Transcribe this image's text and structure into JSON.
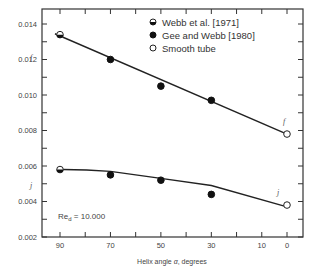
{
  "chart_data": {
    "type": "scatter",
    "title": "",
    "xlabel": "Helix angle α, degrees",
    "ylabel": "f",
    "xlim": [
      90,
      0
    ],
    "ylim": [
      0.002,
      0.014
    ],
    "x_ticks": [
      90,
      80,
      70,
      60,
      50,
      40,
      30,
      20,
      10,
      0
    ],
    "x_tick_labels": [
      "90",
      "70",
      "50",
      "30",
      "10",
      "0"
    ],
    "y_ticks": [
      0.002,
      0.003,
      0.004,
      0.005,
      0.006,
      0.007,
      0.008,
      0.009,
      0.01,
      0.011,
      0.012,
      0.013,
      0.014
    ],
    "y_tick_labels": [
      "0.002",
      "0.004",
      "0.006",
      "0.008",
      "0.010",
      "0.012",
      "0.014"
    ],
    "grid": false,
    "legend_position": "upper right",
    "annotation": "Re_d = 10,000",
    "series": [
      {
        "name": "Webb et al. [1971]",
        "marker": "half-filled circle",
        "group": "upper",
        "x": [
          90
        ],
        "y": [
          0.0134
        ]
      },
      {
        "name": "Gee and Webb [1980]",
        "marker": "filled circle",
        "group": "upper",
        "x": [
          70,
          50,
          30
        ],
        "y": [
          0.012,
          0.0105,
          0.0097
        ]
      },
      {
        "name": "Smooth tube",
        "marker": "open circle",
        "group": "upper",
        "x": [
          0
        ],
        "y": [
          0.0078
        ]
      },
      {
        "name": "Webb et al. [1971]",
        "marker": "half-filled circle",
        "group": "lower",
        "x": [
          90
        ],
        "y": [
          0.0058
        ]
      },
      {
        "name": "Gee and Webb [1980]",
        "marker": "filled circle",
        "group": "lower",
        "x": [
          70,
          50,
          30
        ],
        "y": [
          0.0055,
          0.0052,
          0.0044
        ]
      },
      {
        "name": "Smooth tube",
        "marker": "open circle",
        "group": "lower",
        "x": [
          0
        ],
        "y": [
          0.0038
        ]
      }
    ],
    "fit_lines": [
      {
        "name": "upper fit",
        "x": [
          92,
          0
        ],
        "y": [
          0.01345,
          0.0078
        ]
      },
      {
        "name": "lower fit",
        "x": [
          90,
          70,
          50,
          30,
          0
        ],
        "y": [
          0.0058,
          0.0057,
          0.0053,
          0.0049,
          0.0037
        ]
      }
    ]
  },
  "legend": {
    "items": [
      {
        "label": "Webb et al. [1971]",
        "marker": "half-filled-circle"
      },
      {
        "label": "Gee and Webb [1980]",
        "marker": "filled-circle"
      },
      {
        "label": "Smooth tube",
        "marker": "open-circle"
      }
    ]
  },
  "axes": {
    "xlabel_prefix": "Helix angle ",
    "xlabel_symbol": "α",
    "xlabel_suffix": ", degrees",
    "ylabel_upper": "f",
    "ylabel_lower": "j",
    "annotation_re": "Re",
    "annotation_sub": "d",
    "annotation_value": " = 10.000",
    "line_label_upper": "f",
    "line_label_lower": "j"
  }
}
